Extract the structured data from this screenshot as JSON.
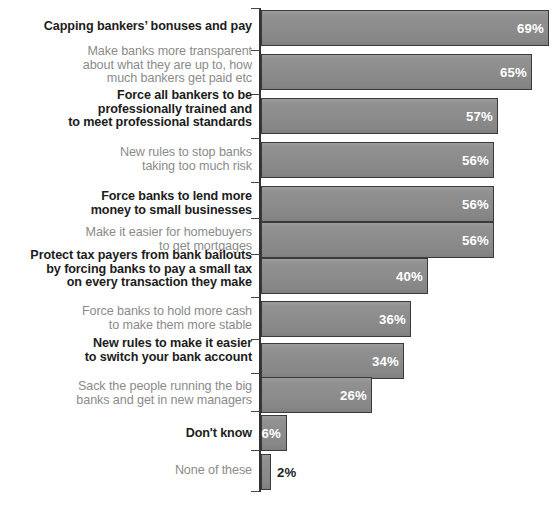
{
  "chart_data": {
    "type": "bar",
    "orientation": "horizontal",
    "title": "",
    "xlabel": "",
    "ylabel": "",
    "xlim": [
      0,
      72
    ],
    "grid": false,
    "legend": null,
    "value_suffix": "%",
    "categories": [
      "Capping bankers’ bonuses and pay",
      "Make banks more transparent\nabout what they are up to, how\nmuch bankers get paid etc",
      "Force all bankers to be\nprofessionally trained and\nto meet professional standards",
      "New rules to stop banks\ntaking too much risk",
      "Force banks to lend more\nmoney to small businesses",
      "Make it easier for homebuyers\nto get mortgages",
      "Protect tax payers from bank bailouts\nby forcing banks to pay a small tax\non every transaction they make",
      "Force banks to hold more cash\nto make them more stable",
      "New rules to make it easier\nto switch your bank account",
      "Sack the people running the big\nbanks and get in new managers",
      "Don't know",
      "None of these"
    ],
    "values": [
      69,
      65,
      57,
      56,
      56,
      56,
      40,
      36,
      34,
      26,
      6,
      2
    ],
    "value_labels": [
      "69%",
      "65%",
      "57%",
      "56%",
      "56%",
      "56%",
      "40%",
      "36%",
      "34%",
      "26%",
      "6%",
      "2%"
    ],
    "colors": {
      "bar_fill": "#8c8c8c",
      "bar_border": "#3a3a3a",
      "label_dark": "#1c1c1c",
      "label_gray": "#8b8b8b",
      "value_inside": "#ffffff",
      "value_outside": "#1f1f1f",
      "axis": "#333333",
      "background": "#ffffff"
    }
  },
  "rows": [
    {
      "label": "Capping bankers’ bonuses and pay",
      "value_label": "69%",
      "emphasis": true,
      "top": 10,
      "height": 36,
      "bar_width": 288,
      "label_top": 20,
      "value_outside": false
    },
    {
      "label": "Make banks more transparent\nabout what they are up to, how\nmuch bankers get paid etc",
      "value_label": "65%",
      "emphasis": false,
      "top": 54,
      "height": 36,
      "bar_width": 271,
      "label_top": 45,
      "value_outside": false
    },
    {
      "label": "Force all bankers to be\nprofessionally trained and\nto meet professional standards",
      "value_label": "57%",
      "emphasis": true,
      "top": 98,
      "height": 36,
      "bar_width": 237,
      "label_top": 89,
      "value_outside": false
    },
    {
      "label": "New rules to stop banks\ntaking too much risk",
      "value_label": "56%",
      "emphasis": false,
      "top": 142,
      "height": 36,
      "bar_width": 233,
      "label_top": 146,
      "value_outside": false
    },
    {
      "label": "Force banks to lend more\nmoney to small businesses",
      "value_label": "56%",
      "emphasis": true,
      "top": 186,
      "height": 36,
      "bar_width": 233,
      "label_top": 190,
      "value_outside": false
    },
    {
      "label": "Make it easier for homebuyers\nto get mortgages",
      "value_label": "56%",
      "emphasis": false,
      "top": 222,
      "height": 36,
      "bar_width": 233,
      "label_top": 226,
      "value_outside": false
    },
    {
      "label": "Protect tax payers from bank bailouts\nby forcing banks to pay a small tax\non every transaction they make",
      "value_label": "40%",
      "emphasis": true,
      "top": 258,
      "height": 36,
      "bar_width": 167,
      "label_top": 249,
      "value_outside": false
    },
    {
      "label": "Force banks to hold more cash\nto make them more stable",
      "value_label": "36%",
      "emphasis": false,
      "top": 301,
      "height": 36,
      "bar_width": 150,
      "label_top": 305,
      "value_outside": false
    },
    {
      "label": "New rules to make it easier\nto switch your bank account",
      "value_label": "34%",
      "emphasis": true,
      "top": 343,
      "height": 36,
      "bar_width": 143,
      "label_top": 337,
      "value_outside": false
    },
    {
      "label": "Sack the people running the big\nbanks and get in new managers",
      "value_label": "26%",
      "emphasis": false,
      "top": 377,
      "height": 36,
      "bar_width": 111,
      "label_top": 380,
      "value_outside": false
    },
    {
      "label": "Don't know",
      "value_label": "6%",
      "emphasis": true,
      "top": 415,
      "height": 36,
      "bar_width": 26,
      "label_top": 427,
      "value_outside": false
    },
    {
      "label": "None of these",
      "value_label": "2%",
      "emphasis": false,
      "top": 454,
      "height": 36,
      "bar_width": 10,
      "label_top": 464,
      "value_outside": true
    }
  ],
  "axis": {
    "ticks_top": [
      8,
      50,
      94,
      138,
      182,
      218,
      254,
      297,
      339,
      373,
      411,
      450,
      491
    ]
  }
}
